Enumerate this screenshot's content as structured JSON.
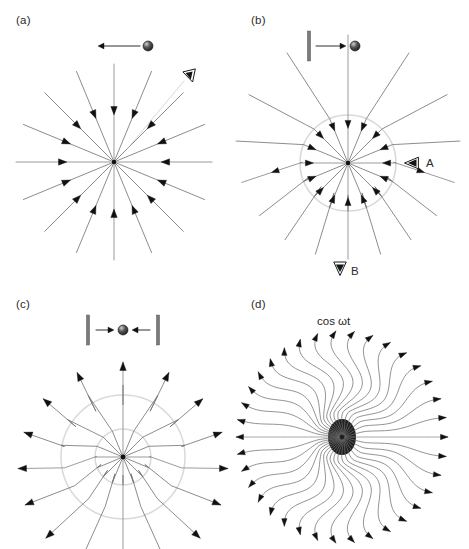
{
  "figure": {
    "background": "#ffffff",
    "width": 469,
    "height": 549,
    "colors": {
      "field_line": "#6e6e6e",
      "axis_line": "#8a8a8a",
      "arrow_head": "#111111",
      "boundary_circle": "#d9d9d9",
      "charge_body": "#4a4a4a",
      "charge_highlight": "#d0d0d0",
      "wall_bar": "#7a7a7a",
      "label_text": "#2b2b2b"
    }
  },
  "panels": [
    {
      "id": "a",
      "label": "(a)",
      "label_x": 16,
      "label_y": 24,
      "description": "uniformly-moving charge, purely radial field",
      "center": {
        "x": 114,
        "y": 162
      },
      "ray_count": 16,
      "ray_length": 98,
      "arrow_direction": "inward",
      "arrow_fraction": 0.48,
      "charge": {
        "name": "moving-charge",
        "x": 148,
        "y": 46,
        "radius": 5,
        "motion": "left",
        "arrow_from_x": 140,
        "arrow_to_x": 98,
        "arrow_y": 46
      },
      "observers": [
        {
          "name": "observer-eye",
          "label": "",
          "x": 190,
          "y": 76,
          "direction": "up-left"
        }
      ],
      "walls": []
    },
    {
      "id": "b",
      "label": "(b)",
      "label_x": 251,
      "label_y": 24,
      "description": "charge suddenly stopped by a wall, single kink shell",
      "center": {
        "x": 348,
        "y": 163
      },
      "ray_count": 16,
      "ray_length": 112,
      "arrow_direction": "inward",
      "arrow_fraction": 0.3,
      "kink_radius": 48,
      "offset": {
        "x": 0,
        "y": -16
      },
      "charge": {
        "name": "stopped-charge",
        "x": 355,
        "y": 46,
        "radius": 5,
        "motion": "right",
        "arrow_from_x": 316,
        "arrow_to_x": 346,
        "arrow_y": 46
      },
      "observers": [
        {
          "name": "observer-a",
          "label": "A",
          "x": 412,
          "y": 163,
          "direction": "left",
          "label_x": 426,
          "label_y": 167
        },
        {
          "name": "observer-b",
          "label": "B",
          "x": 340,
          "y": 268,
          "direction": "down",
          "label_x": 351,
          "label_y": 275
        }
      ],
      "walls": [
        {
          "name": "wall-left",
          "x": 309,
          "y": 46,
          "height": 30
        }
      ]
    },
    {
      "id": "c",
      "label": "(c)",
      "label_x": 16,
      "label_y": 308,
      "description": "oscillating charge between two walls, double kink shells",
      "center": {
        "x": 123,
        "y": 457
      },
      "ray_count": 16,
      "ray_length": 105,
      "arrow_direction": "outward",
      "arrow_fraction": 0.92,
      "kink_radius_inner": 28,
      "kink_radius_outer": 62,
      "offset": {
        "x": 0,
        "y": -10
      },
      "charge": {
        "name": "oscillating-charge",
        "x": 123,
        "y": 330,
        "radius": 5,
        "motion": "oscillating",
        "arrow_y": 330
      },
      "walls": [
        {
          "name": "wall-left",
          "x": 88,
          "y": 330,
          "height": 30
        },
        {
          "name": "wall-right",
          "x": 158,
          "y": 330,
          "height": 30
        }
      ],
      "observers": []
    },
    {
      "id": "d",
      "label": "(d)",
      "label_x": 251,
      "label_y": 308,
      "description": "sinusoidally oscillating dipole, radiating wave field",
      "caption": "cos ωt",
      "caption_x": 342,
      "caption_y": 323,
      "center": {
        "x": 342,
        "y": 437
      },
      "ray_count": 36,
      "ray_length": 106,
      "core_radius_x": 14,
      "core_radius_y": 18,
      "wave_amplitude": 11,
      "wave_cycles": 1.35,
      "arrow_direction": "outward"
    }
  ]
}
